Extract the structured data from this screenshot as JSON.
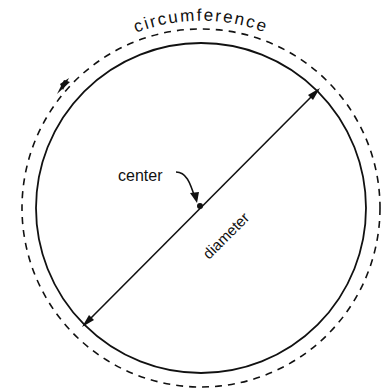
{
  "diagram": {
    "labels": {
      "circumference": "circumference",
      "center": "center",
      "diameter": "diameter"
    },
    "colors": {
      "stroke": "#111111",
      "background": "#ffffff"
    }
  }
}
